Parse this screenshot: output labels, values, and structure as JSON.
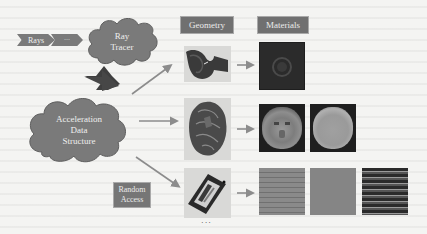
{
  "diagram": {
    "input": {
      "rays_label": "Rays",
      "ellipsis_label": "···"
    },
    "ray_tracer": {
      "line1": "Ray",
      "line2": "Tracer"
    },
    "acceleration": {
      "line1": "Acceleration",
      "line2": "Data",
      "line3": "Structure"
    },
    "random_access": {
      "line1": "Random",
      "line2": "Access"
    },
    "columns": {
      "geometry": "Geometry",
      "materials": "Materials"
    },
    "rows": [
      {
        "geometry": "curved-sheet-model",
        "materials": [
          "dark-circular-texture"
        ]
      },
      {
        "geometry": "lion-head-model",
        "materials": [
          "lion-face-color-texture",
          "lion-face-gray-texture"
        ]
      },
      {
        "geometry": "box-object-model",
        "materials": [
          "brick-wall-texture",
          "flat-gray-texture",
          "dark-brick-texture"
        ]
      }
    ],
    "more_rows_indicator": "···",
    "colors": {
      "shape_fill": "#7a7a7a",
      "arrow": "#8c8c8c",
      "dark_arrow": "#3f3f3f",
      "label_bg": "#707070",
      "background": "#f4f4f2"
    }
  }
}
